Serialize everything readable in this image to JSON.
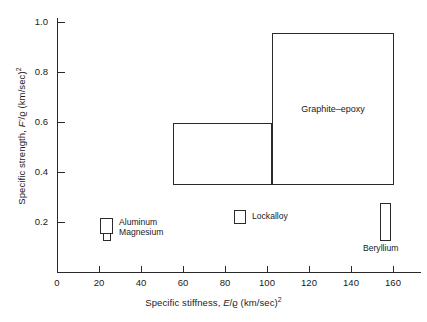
{
  "chart_data": {
    "type": "scatter",
    "title": "",
    "xlabel": "Specific stiffness, E/ϱ (km/sec)²",
    "ylabel": "Specific strength, F'/ϱ (km/sec)²",
    "xlabel_parts": {
      "prefix": "Specific stiffness, ",
      "symbol": "E",
      "slash": "/",
      "rho": "ϱ",
      "units": " (km/sec)",
      "exp": "2"
    },
    "ylabel_parts": {
      "prefix": "Specific strength, ",
      "symbol": "F'",
      "slash": "/",
      "rho": "ϱ",
      "units": " (km/sec)",
      "exp": "2"
    },
    "xlim": [
      0,
      173
    ],
    "ylim": [
      0,
      1.07
    ],
    "grid": false,
    "legend": "none",
    "xticks": [
      0,
      20,
      40,
      60,
      80,
      100,
      120,
      140,
      160
    ],
    "xtick_labels": [
      "0",
      "20",
      "40",
      "60",
      "80",
      "100",
      "120",
      "140",
      "160"
    ],
    "yticks": [
      0.2,
      0.4,
      0.6,
      0.8,
      1.0
    ],
    "ytick_labels": [
      "0.2",
      "0.4",
      "0.6",
      "0.8",
      "1.0"
    ],
    "regions": [
      {
        "name": "graphite-epoxy",
        "label": "Graphite–epoxy",
        "x_range": [
          102,
          160
        ],
        "y_range": [
          0.348,
          0.955
        ]
      },
      {
        "name": "boron-epoxy",
        "label": "Boron–epoxy",
        "x_range": [
          55,
          102
        ],
        "y_range": [
          0.348,
          0.596
        ]
      },
      {
        "name": "beryllium",
        "label": "Beryllium",
        "x_range": [
          154,
          159
        ],
        "y_range": [
          0.124,
          0.276
        ]
      },
      {
        "name": "lockalloy",
        "label": "Lockalloy",
        "x_range": [
          84,
          90
        ],
        "y_range": [
          0.196,
          0.248
        ]
      },
      {
        "name": "aluminum",
        "label": "Aluminum",
        "x_range": [
          20,
          27
        ],
        "y_range": [
          0.152,
          0.216
        ]
      },
      {
        "name": "magnesium",
        "label": "Magnesium",
        "x_range": [
          22,
          26
        ],
        "y_range": [
          0.124,
          0.176
        ]
      }
    ]
  }
}
